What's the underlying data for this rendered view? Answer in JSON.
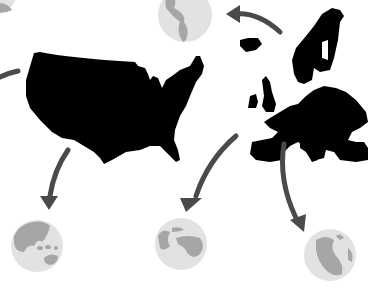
{
  "illustration": {
    "description": "USA and Europe silhouettes with arrows pointing to globes",
    "colors": {
      "background": "#ffffff",
      "silhouette": "#000000",
      "arrow": "#4a4a4a",
      "globe_ocean": "#e2e2e2",
      "globe_land": "#a6a6a6"
    },
    "regions": [
      {
        "name": "united-states",
        "shape": "map-silhouette"
      },
      {
        "name": "europe",
        "shape": "map-silhouette"
      }
    ],
    "globes": [
      {
        "name": "americas-globe",
        "view": "americas"
      },
      {
        "name": "asia-pacific-globe",
        "view": "asia-oceania"
      },
      {
        "name": "africa-europe-globe",
        "view": "africa-europe"
      },
      {
        "name": "south-america-globe",
        "view": "south-america"
      },
      {
        "name": "partial-globe-top-left",
        "view": "partial"
      }
    ]
  }
}
